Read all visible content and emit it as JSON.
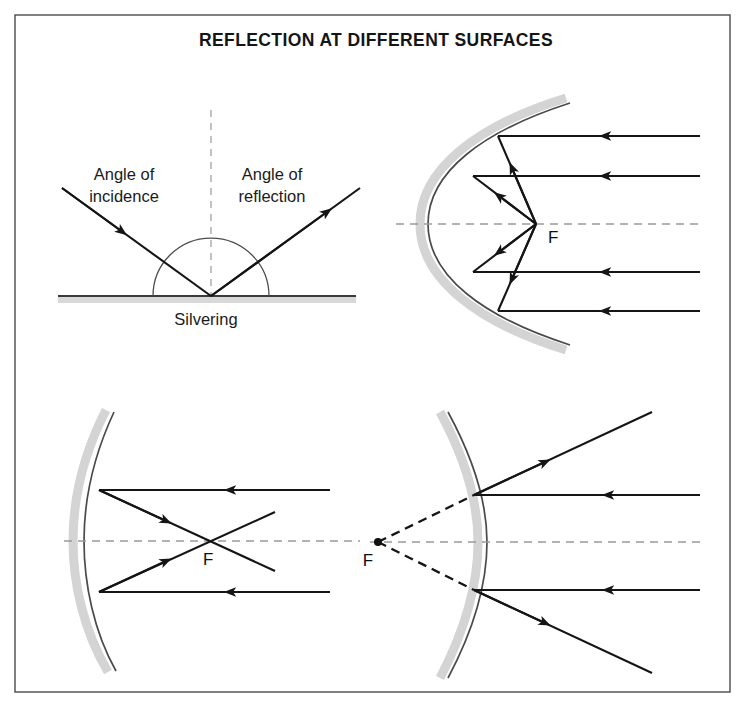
{
  "page": {
    "width": 752,
    "height": 718,
    "background": "#ffffff"
  },
  "frame": {
    "x": 15,
    "y": 15,
    "width": 715,
    "height": 677,
    "stroke": "#4a4a4a"
  },
  "title": {
    "text": "REFLECTION AT DIFFERENT SURFACES",
    "x": 376,
    "y": 46
  },
  "colors": {
    "ink": "#151515",
    "mirror": "#4a4a4a",
    "silvering": "#d4d4d4",
    "axis": "#9a9a9a",
    "frame": "#4a4a4a"
  },
  "panels": [
    {
      "id": "plane-mirror",
      "name": "Plane mirror reflection",
      "labels": [
        {
          "name": "angle-of-incidence-label",
          "line1": "Angle of",
          "line2": "incidence",
          "x": 124,
          "y1": 180,
          "y2": 202
        },
        {
          "name": "angle-of-reflection-label",
          "line1": "Angle of",
          "line2": "reflection",
          "x": 272,
          "y1": 180,
          "y2": 202
        },
        {
          "name": "silvering-label",
          "text": "Silvering",
          "x": 206,
          "y": 325
        }
      ],
      "mirror": {
        "x1": 58,
        "x2": 356,
        "y": 296
      },
      "silvering_band": {
        "x": 58,
        "y": 297,
        "width": 298,
        "height": 6
      },
      "normal": {
        "x": 211,
        "y1": 110,
        "y2": 296
      },
      "arc": {
        "cx": 211,
        "cy": 296,
        "r": 58
      },
      "incident_ray": {
        "x1": 62,
        "y1": 188,
        "x2": 211,
        "y2": 296,
        "arrow_t": 0.42
      },
      "reflected_ray": {
        "x1": 211,
        "y1": 296,
        "x2": 360,
        "y2": 188,
        "arrow_t": 0.78
      }
    },
    {
      "id": "concave-mirror-deep",
      "name": "Deep concave mirror converging rays to focus",
      "axis": {
        "x1": 396,
        "x2": 700,
        "y": 224
      },
      "focus": {
        "x": 536,
        "y": 224,
        "label": "F",
        "label_x": 548,
        "label_y": 243
      },
      "mirror_vertex_x": 462,
      "rays": [
        {
          "y": 136,
          "hit_x": 498,
          "start_x": 700
        },
        {
          "y": 176,
          "hit_x": 473,
          "start_x": 700
        },
        {
          "y": 272,
          "hit_x": 473,
          "start_x": 700
        },
        {
          "y": 311,
          "hit_x": 498,
          "start_x": 700
        }
      ]
    },
    {
      "id": "concave-mirror-shallow",
      "name": "Shallow concave mirror rays crossing at focus",
      "axis": {
        "x1": 64,
        "x2": 360,
        "y": 541
      },
      "focus": {
        "x": 208,
        "y": 541,
        "label": "F",
        "label_x": 203,
        "label_y": 565
      },
      "mirror_vertex_x": 87,
      "rays": [
        {
          "y": 490,
          "hit_x": 99,
          "start_x": 330,
          "out_x": 275,
          "out_y": 571
        },
        {
          "y": 592,
          "hit_x": 99,
          "start_x": 330,
          "out_x": 275,
          "out_y": 512
        }
      ]
    },
    {
      "id": "convex-mirror",
      "name": "Convex mirror with diverging rays and virtual focus",
      "axis": {
        "x1": 370,
        "x2": 700,
        "y": 542
      },
      "focus": {
        "x": 378,
        "y": 542,
        "label": "F",
        "label_x": 368,
        "label_y": 566,
        "dot_r": 4
      },
      "mirror_vertex_x": 487,
      "rays": [
        {
          "y": 495,
          "hit_x": 474,
          "start_x": 700,
          "out_x": 652,
          "out_y": 412
        },
        {
          "y": 590,
          "hit_x": 474,
          "start_x": 700,
          "out_x": 652,
          "out_y": 673
        }
      ]
    }
  ]
}
